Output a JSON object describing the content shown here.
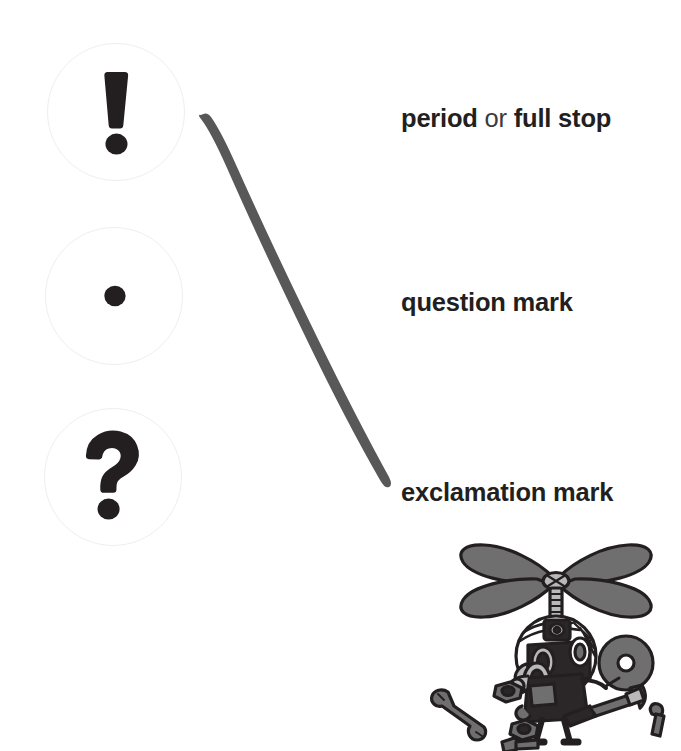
{
  "page": {
    "background_color": "#ffffff",
    "width": 681,
    "height": 751
  },
  "bubbles": [
    {
      "id": "exclamation",
      "glyph_name": "exclamation-mark-glyph",
      "glyph": "!",
      "ring_color": "#efeef0",
      "glyph_color": "#231f20",
      "cx": 116,
      "cy": 112,
      "r": 69
    },
    {
      "id": "period",
      "glyph_name": "period-dot-glyph",
      "glyph": ".",
      "ring_color": "#efeef0",
      "glyph_color": "#231f20",
      "cx": 114,
      "cy": 296,
      "r": 69
    },
    {
      "id": "question",
      "glyph_name": "question-mark-glyph",
      "glyph": "?",
      "ring_color": "#efeef0",
      "glyph_color": "#231f20",
      "cx": 113,
      "cy": 477,
      "r": 69
    }
  ],
  "connector": {
    "name": "pointer-curve",
    "color": "#585858",
    "description": "tapered hand-drawn curve sweeping from the top bubble down to the bottom label"
  },
  "labels": [
    {
      "id": "label-period",
      "parts": [
        {
          "text": "period",
          "emphasis": "strong"
        },
        {
          "text": " or ",
          "emphasis": "weak"
        },
        {
          "text": "full stop",
          "emphasis": "strong"
        }
      ],
      "plain": "period or full stop",
      "top": 106
    },
    {
      "id": "label-question",
      "parts": [
        {
          "text": "question mark",
          "emphasis": "strong"
        }
      ],
      "plain": "question mark",
      "top": 290
    },
    {
      "id": "label-exclamation",
      "parts": [
        {
          "text": "exclamation mark",
          "emphasis": "strong"
        }
      ],
      "plain": "exclamation mark",
      "top": 480
    }
  ],
  "mascot": {
    "name": "helicopter-mechanic-character",
    "description": "cartoon character with a four-blade helicopter rotor on his head, goggles, headlamp and a big nose, holding a reel and a tool, surrounded by scattered nuts, bolts, a wrench and a screwdriver",
    "colors": {
      "outline": "#231f20",
      "mid_gray": "#6f6f6f",
      "light_gray": "#b9b9b9",
      "pale_gray": "#d9d9d9",
      "body_dark": "#2b2728"
    },
    "parts": [
      "rotor-blades",
      "rotor-hub",
      "rotor-mast",
      "head",
      "headband",
      "headlamp",
      "goggles",
      "nose",
      "body",
      "arms",
      "legs",
      "reel",
      "hand-tool",
      "wrench",
      "hex-nut-left",
      "hex-nut-center",
      "bolt-center",
      "screwdriver",
      "bolt-right"
    ]
  }
}
